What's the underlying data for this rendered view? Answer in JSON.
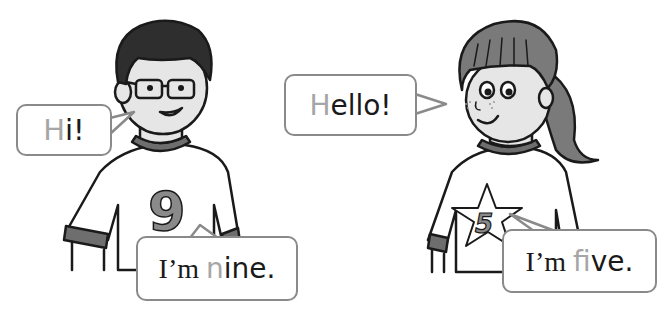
{
  "scene": {
    "description": "Two children introducing themselves with speech bubbles",
    "colors": {
      "background": "#ffffff",
      "outline": "#1a1a1a",
      "bubble_border": "#8a8a8a",
      "highlight_letter": "#a6a6a6",
      "hair_boy": "#2e2e2e",
      "hair_girl": "#7a7a7a",
      "shirt": "#ffffff",
      "trim": "#6e6e6e",
      "skin": "#e6e6e6"
    }
  },
  "boy": {
    "shirt_number": "9",
    "bubbles": [
      {
        "id": "hi",
        "highlight": "H",
        "rest": "i!"
      },
      {
        "id": "nine",
        "before": "I’m ",
        "highlight": "n",
        "rest": "ine."
      }
    ]
  },
  "girl": {
    "shirt_number": "5",
    "bubbles": [
      {
        "id": "hello",
        "highlight": "H",
        "rest": "ello!"
      },
      {
        "id": "five",
        "before": "I’m ",
        "highlight": "f",
        "rest": "ive."
      }
    ]
  }
}
